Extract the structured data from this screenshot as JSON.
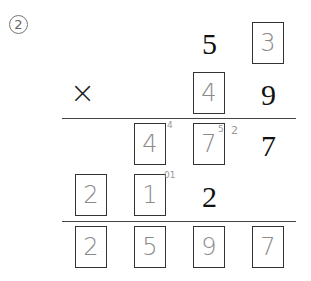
{
  "problem_number": "2",
  "operator": "×",
  "multiplicand": {
    "tens": "5",
    "ones_answer": "3"
  },
  "multiplier": {
    "tens_answer": "4",
    "ones": "9"
  },
  "partial1": {
    "hundreds_answer": "4",
    "tens_answer": "7",
    "ones": "7",
    "carry_a": "4",
    "carry_b": "5",
    "carry_c": "2"
  },
  "partial2": {
    "thousands_answer": "2",
    "hundreds_answer": "1",
    "tens": "2",
    "carry_d": "01"
  },
  "result": {
    "thousands": "2",
    "hundreds": "5",
    "tens": "9",
    "ones": "7"
  }
}
